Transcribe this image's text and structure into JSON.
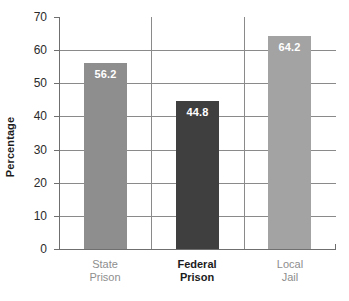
{
  "chart_data": {
    "type": "bar",
    "title": "",
    "subtitle": "",
    "xlabel": "",
    "ylabel": "Percentage",
    "ylim": [
      0,
      70
    ],
    "ytick_step": 10,
    "yticks": [
      "70",
      "60",
      "50",
      "40",
      "30",
      "20",
      "10",
      "0"
    ],
    "grid": true,
    "legend": null,
    "categories": [
      "State Prison",
      "Federal Prison",
      "Local Jail"
    ],
    "values": [
      56.2,
      44.8,
      64.2
    ],
    "bars": [
      {
        "category_line1": "State",
        "category_line2": "Prison",
        "value": 56.2,
        "value_label": "56.2",
        "color": "#8e8e8e",
        "label_emphasis": "muted"
      },
      {
        "category_line1": "Federal",
        "category_line2": "Prison",
        "value": 44.8,
        "value_label": "44.8",
        "color": "#3f3f3f",
        "label_emphasis": "strong"
      },
      {
        "category_line1": "Local",
        "category_line2": "Jail",
        "value": 64.2,
        "value_label": "64.2",
        "color": "#a3a3a3",
        "label_emphasis": "muted"
      }
    ],
    "colors": {
      "axis": "#6f6f6f",
      "grid": "#8a8a8a",
      "value_label": "#ffffff",
      "tick_text": "#2b2b2b",
      "axis_title": "#1c1c1c",
      "background": "#ffffff"
    }
  }
}
